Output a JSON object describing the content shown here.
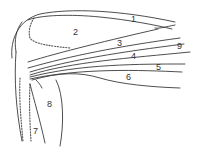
{
  "diagram": {
    "type": "anatomical line drawing (shoulder / upper arm muscles)",
    "labels": [
      {
        "id": "1",
        "text": "1",
        "x": 131,
        "y": 22
      },
      {
        "id": "2",
        "text": "2",
        "x": 73,
        "y": 35
      },
      {
        "id": "3",
        "text": "3",
        "x": 117,
        "y": 46
      },
      {
        "id": "9",
        "text": "9",
        "x": 177,
        "y": 49
      },
      {
        "id": "4",
        "text": "4",
        "x": 131,
        "y": 59
      },
      {
        "id": "5",
        "text": "5",
        "x": 156,
        "y": 70
      },
      {
        "id": "6",
        "text": "6",
        "x": 126,
        "y": 80
      },
      {
        "id": "8",
        "text": "8",
        "x": 47,
        "y": 107
      },
      {
        "id": "7",
        "text": "7",
        "x": 33,
        "y": 134
      }
    ],
    "colors": {
      "line": "#3a3a3a",
      "background": "#ffffff"
    }
  }
}
